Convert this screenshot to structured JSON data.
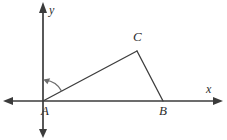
{
  "figure": {
    "background_color": "#ffffff",
    "line_color": "#3d3d3d",
    "axis_color": "#3b3b3b",
    "arc_color": "#6d6d6d",
    "width": 227,
    "height": 140
  },
  "axes": {
    "x_axis": {
      "label": "x",
      "y_pixel": 101,
      "x_start": 4,
      "x_end": 222,
      "arrow_left": true,
      "arrow_right": true
    },
    "y_axis": {
      "label": "y",
      "x_pixel": 43,
      "y_start": 4,
      "y_end": 137,
      "arrow_up": true,
      "arrow_down": true
    },
    "origin": {
      "x": 43,
      "y": 101
    }
  },
  "points": [
    {
      "label": "A",
      "x": 43,
      "y": 101,
      "position": "origin"
    },
    {
      "label": "B",
      "x": 163,
      "y": 101,
      "position": "on-x-axis"
    },
    {
      "label": "C",
      "x": 137,
      "y": 51,
      "position": "above-axis"
    }
  ],
  "segments": [
    {
      "name": "AC",
      "from": "A",
      "to": "C"
    },
    {
      "name": "CB",
      "from": "C",
      "to": "B"
    }
  ],
  "angle_arc": {
    "vertex": "A",
    "from_ray": "AC",
    "to_ray": "y-axis",
    "radius": 21,
    "direction": "counterclockwise",
    "arrowhead": true
  }
}
